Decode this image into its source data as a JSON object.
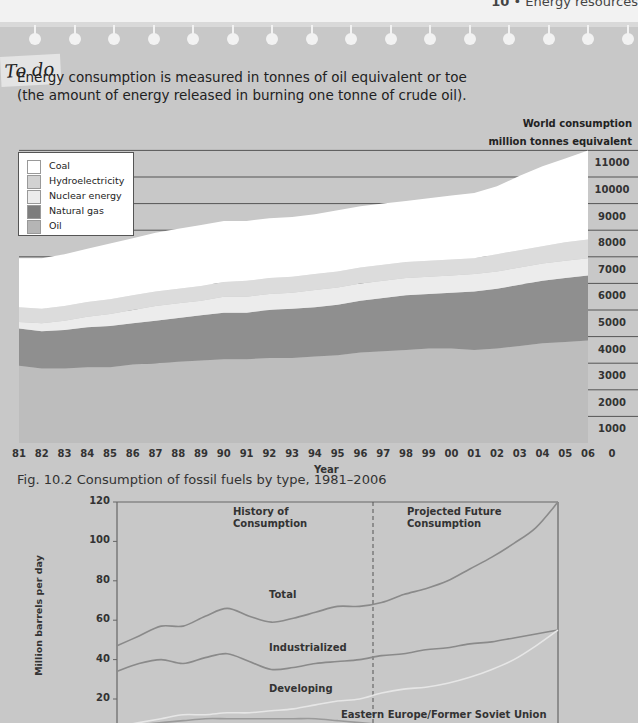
{
  "page_header": {
    "chapter_number": "10",
    "separator": "•",
    "chapter_title": "Energy resources"
  },
  "panel": {
    "tag": "To do",
    "intro_line1": "Energy consumption is measured in tonnes of oil equivalent or toe",
    "intro_line2": "(the amount of energy released in burning one tonne of crude oil)."
  },
  "colors": {
    "panel_bg": "#c8c8c8",
    "coal": "#ffffff",
    "hydroelectricity": "#dcdcdc",
    "nuclear": "#ececec",
    "natural_gas": "#8f8f8f",
    "oil": "#bdbdbd",
    "line_total": "#8a8a8a",
    "line_industrialized": "#8a8a8a",
    "line_developing": "#e6e6e6",
    "line_eastern_europe": "#9a9a9a"
  },
  "chart_data": [
    {
      "type": "area",
      "stacked": true,
      "title": "Fig. 10.2 Consumption of fossil fuels by type, 1981–2006",
      "xlabel": "Year",
      "ylabel": "World consumption million tonnes equivalent",
      "ylabel_line1": "World consumption",
      "ylabel_line2": "million tonnes equivalent",
      "ylim": [
        0,
        11000
      ],
      "yticks": [
        0,
        1000,
        2000,
        3000,
        4000,
        5000,
        6000,
        7000,
        8000,
        9000,
        10000,
        11000
      ],
      "categories": [
        "81",
        "82",
        "83",
        "84",
        "85",
        "86",
        "87",
        "88",
        "89",
        "90",
        "91",
        "92",
        "93",
        "94",
        "95",
        "96",
        "97",
        "98",
        "99",
        "00",
        "01",
        "02",
        "03",
        "04",
        "05",
        "06"
      ],
      "legend": [
        "Coal",
        "Hydroelectricity",
        "Nuclear energy",
        "Natural gas",
        "Oil"
      ],
      "legend_position": "top-left",
      "series": [
        {
          "name": "Oil",
          "values": [
            2900,
            2800,
            2800,
            2850,
            2850,
            2950,
            3000,
            3050,
            3100,
            3150,
            3150,
            3200,
            3200,
            3250,
            3300,
            3400,
            3450,
            3500,
            3550,
            3550,
            3500,
            3550,
            3650,
            3750,
            3800,
            3850
          ]
        },
        {
          "name": "Natural gas",
          "values": [
            1400,
            1400,
            1450,
            1500,
            1550,
            1550,
            1600,
            1650,
            1700,
            1750,
            1750,
            1800,
            1850,
            1850,
            1900,
            1950,
            2000,
            2050,
            2050,
            2100,
            2200,
            2250,
            2300,
            2350,
            2400,
            2450
          ]
        },
        {
          "name": "Nuclear energy",
          "values": [
            250,
            300,
            350,
            400,
            450,
            500,
            550,
            550,
            550,
            600,
            600,
            600,
            600,
            650,
            650,
            650,
            650,
            650,
            650,
            650,
            650,
            650,
            650,
            650,
            650,
            650
          ]
        },
        {
          "name": "Hydroelectricity",
          "values": [
            550,
            550,
            550,
            550,
            550,
            550,
            550,
            550,
            550,
            550,
            600,
            600,
            600,
            600,
            600,
            600,
            600,
            600,
            600,
            600,
            600,
            650,
            650,
            650,
            700,
            700
          ]
        },
        {
          "name": "Coal",
          "values": [
            1850,
            1900,
            1950,
            2000,
            2100,
            2150,
            2200,
            2250,
            2300,
            2300,
            2250,
            2250,
            2250,
            2250,
            2300,
            2300,
            2300,
            2300,
            2350,
            2400,
            2450,
            2550,
            2800,
            3000,
            3150,
            3350
          ]
        }
      ],
      "grid": true
    },
    {
      "type": "line",
      "title": "",
      "ylabel": "Million barrels per day",
      "ylim": [
        0,
        120
      ],
      "yticks": [
        20,
        40,
        60,
        80,
        100,
        120
      ],
      "annotations": [
        "History of Consumption",
        "Projected Future Consumption"
      ],
      "history_label_line1": "History of",
      "history_label_line2": "Consumption",
      "projected_label_line1": "Projected Future",
      "projected_label_line2": "Consumption",
      "divider": "dashed vertical line separating history from projection",
      "x_relative": [
        0,
        0.05,
        0.1,
        0.15,
        0.2,
        0.25,
        0.3,
        0.35,
        0.4,
        0.45,
        0.5,
        0.55,
        0.6,
        0.65,
        0.7,
        0.75,
        0.8,
        0.85,
        0.9,
        0.95,
        1.0
      ],
      "series": [
        {
          "name": "Total",
          "values": [
            47,
            52,
            57,
            57,
            62,
            66,
            62,
            59,
            61,
            64,
            67,
            67,
            69,
            73,
            76,
            80,
            86,
            92,
            99,
            107,
            120
          ]
        },
        {
          "name": "Industrialized",
          "values": [
            34,
            38,
            40,
            38,
            41,
            43,
            39,
            35,
            36,
            38,
            39,
            40,
            42,
            43,
            45,
            46,
            48,
            49,
            51,
            53,
            55
          ]
        },
        {
          "name": "Developing",
          "values": [
            6,
            8,
            10,
            12,
            12,
            13,
            13,
            14,
            15,
            17,
            19,
            20,
            23,
            25,
            26,
            28,
            31,
            35,
            40,
            47,
            55
          ]
        },
        {
          "name": "Eastern Europe/Former Soviet Union",
          "values": [
            6,
            7,
            8,
            9,
            10,
            10,
            10,
            10,
            10,
            10,
            9,
            8,
            7,
            6,
            6,
            6,
            6,
            6,
            6,
            7,
            7
          ]
        }
      ],
      "series_labels": {
        "total": "Total",
        "industrialized": "Industrialized",
        "developing": "Developing",
        "eastern_europe": "Eastern Europe/Former Soviet Union"
      }
    }
  ]
}
